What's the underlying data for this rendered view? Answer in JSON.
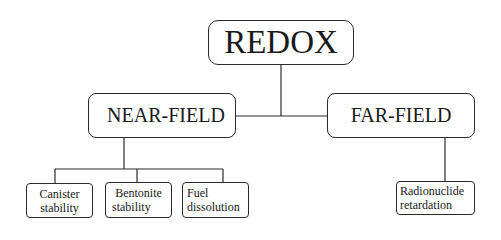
{
  "diagram": {
    "type": "hierarchy-tree",
    "root": {
      "label": "REDOX",
      "children": [
        {
          "label": "NEAR-FIELD",
          "children": [
            {
              "label_lines": [
                "Canister",
                "stability"
              ]
            },
            {
              "label_lines": [
                "Bentonite",
                "stability"
              ]
            },
            {
              "label_lines": [
                "Fuel",
                "dissolution"
              ]
            }
          ]
        },
        {
          "label": "FAR-FIELD",
          "children": [
            {
              "label_lines": [
                "Radionuclide",
                "retardation"
              ]
            }
          ]
        }
      ]
    }
  }
}
